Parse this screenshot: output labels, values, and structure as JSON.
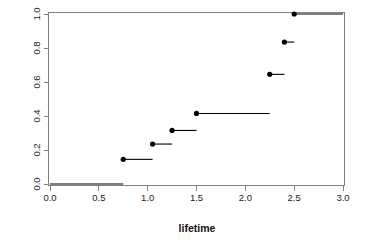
{
  "chart_data": {
    "type": "line",
    "subtype": "ecdf-step",
    "title": "",
    "xlabel": "lifetime",
    "ylabel": "",
    "xlim": [
      0.0,
      3.0
    ],
    "ylim": [
      0.0,
      1.0
    ],
    "grid": false,
    "legend": null,
    "x_ticks": [
      0.0,
      0.5,
      1.0,
      1.5,
      2.0,
      2.5,
      3.0
    ],
    "x_tick_labels": [
      "0.0",
      "0.5",
      "1.0",
      "1.5",
      "2.0",
      "2.5",
      "3.0"
    ],
    "y_ticks": [
      0.0,
      0.2,
      0.4,
      0.6,
      0.8,
      1.0
    ],
    "y_tick_labels": [
      "0.0",
      "0.2",
      "0.4",
      "0.6",
      "0.8",
      "1.0"
    ],
    "jump_x": [
      0.75,
      1.05,
      1.25,
      1.5,
      2.25,
      2.4,
      2.5
    ],
    "jump_y": [
      0.145,
      0.235,
      0.315,
      0.415,
      0.645,
      0.835,
      1.0
    ],
    "baseline_y": 0.0,
    "baseline_x_start": 0.0,
    "baseline_x_end": 0.75,
    "final_x_end": 3.0,
    "segments": [
      {
        "y": 0.0,
        "x_start": 0.0,
        "x_end": 0.75,
        "dot": false
      },
      {
        "y": 0.145,
        "x_start": 0.75,
        "x_end": 1.05,
        "dot": true
      },
      {
        "y": 0.235,
        "x_start": 1.05,
        "x_end": 1.25,
        "dot": true
      },
      {
        "y": 0.315,
        "x_start": 1.25,
        "x_end": 1.5,
        "dot": true
      },
      {
        "y": 0.415,
        "x_start": 1.5,
        "x_end": 2.25,
        "dot": true
      },
      {
        "y": 0.645,
        "x_start": 2.25,
        "x_end": 2.4,
        "dot": true
      },
      {
        "y": 0.835,
        "x_start": 2.4,
        "x_end": 2.5,
        "dot": true
      },
      {
        "y": 1.0,
        "x_start": 2.5,
        "x_end": 3.0,
        "dot": true
      }
    ],
    "colors": {
      "line": "#000000",
      "dot": "#000000",
      "axis": "#808080",
      "text": "#1a1a1a",
      "background": "#ffffff"
    }
  },
  "figure": {
    "x_axis_title": "lifetime",
    "y_axis_title": ""
  }
}
